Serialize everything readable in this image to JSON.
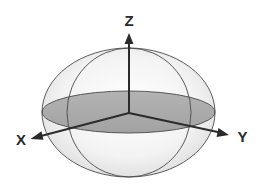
{
  "figure": {
    "background": "#ffffff",
    "colors": {
      "sphere_fill_light": "#ffffff",
      "sphere_fill_dark": "#e4e4e4",
      "equatorial_plane": "#a9a9a9",
      "wireframe": "#4a4a4a",
      "axis": "#2b2b2b",
      "label": "#2a2a2a"
    },
    "axes": [
      {
        "name": "z",
        "label": "Z",
        "direction": "up"
      },
      {
        "name": "x",
        "label": "X",
        "direction": "lower-left"
      },
      {
        "name": "y",
        "label": "Y",
        "direction": "lower-right"
      }
    ],
    "shapes": {
      "outer_ellipse": "meridian outline (wide)",
      "inner_ellipse": "meridian outline (narrow)",
      "equatorial_disc": "shaded horizontal plane"
    }
  }
}
